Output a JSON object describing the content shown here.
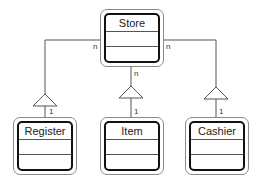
{
  "diagram": {
    "type": "uml-class-diagram",
    "classes": [
      {
        "id": "store",
        "name": "Store",
        "attributes": [],
        "operations": []
      },
      {
        "id": "register",
        "name": "Register",
        "attributes": [],
        "operations": []
      },
      {
        "id": "item",
        "name": "Item",
        "attributes": [],
        "operations": []
      },
      {
        "id": "cashier",
        "name": "Cashier",
        "attributes": [],
        "operations": []
      }
    ],
    "relationships": [
      {
        "from": "store",
        "to": "register",
        "kind": "aggregation-triangle",
        "store_multiplicity": "n",
        "part_multiplicity": "1"
      },
      {
        "from": "store",
        "to": "item",
        "kind": "aggregation-triangle",
        "store_multiplicity": "n",
        "part_multiplicity": "1"
      },
      {
        "from": "store",
        "to": "cashier",
        "kind": "aggregation-triangle",
        "store_multiplicity": "n",
        "part_multiplicity": "1"
      }
    ],
    "labels": {
      "store": "Store",
      "register": "Register",
      "item": "Item",
      "cashier": "Cashier",
      "mult_left_n": "n",
      "mult_mid_n": "n",
      "mult_right_n": "n",
      "mult_left_1": "1",
      "mult_mid_1": "1",
      "mult_right_1": "1"
    },
    "colors": {
      "line": "#555555",
      "box_border": "#111111",
      "outer_border": "#8a8a8a",
      "background": "#ffffff"
    }
  }
}
